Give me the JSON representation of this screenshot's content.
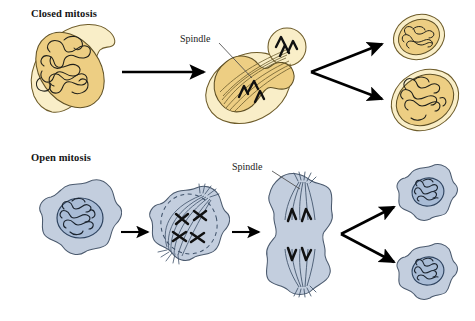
{
  "figure": {
    "title_closed": "Closed mitosis",
    "title_open": "Open mitosis",
    "spindle_label_closed": "Spindle",
    "spindle_label_open": "Spindle"
  },
  "colors": {
    "closed_cytoplasm": "#f9eec8",
    "closed_nucleus": "#edce83",
    "closed_outline": "#6e5c2a",
    "open_cytoplasm": "#c3cede",
    "open_nucleus": "#a9bcd6",
    "open_outline": "#4b5a6e",
    "chromatin": "#1c1c1c",
    "arrow": "#000000",
    "text": "#141414",
    "background": "#ffffff"
  },
  "rows": [
    {
      "name": "closed-mitosis",
      "label": "Closed mitosis",
      "envelope_behavior": "nuclear envelope remains intact",
      "division_type": "budding, unequal daughter cells",
      "stages": [
        {
          "name": "interphase",
          "description": "oval cell with intact nucleus containing tangled chromatin"
        },
        {
          "name": "mitosis",
          "description": "budding cell, spindle inside intact nuclear envelope spanning mother and bud"
        },
        {
          "name": "daughter-small",
          "description": "small daughter cell with nucleus"
        },
        {
          "name": "daughter-large",
          "description": "large daughter cell with nucleus"
        }
      ]
    },
    {
      "name": "open-mitosis",
      "label": "Open mitosis",
      "envelope_behavior": "nuclear envelope breaks down",
      "division_type": "equal daughter cells",
      "stages": [
        {
          "name": "interphase",
          "description": "amoeboid cell with intact round nucleus and chromatin"
        },
        {
          "name": "metaphase",
          "description": "nuclear envelope dashed/breaking down, condensed X chromosomes on spindle"
        },
        {
          "name": "anaphase",
          "description": "elongated dumbbell cell, chromosomes pulled to opposite poles by spindle"
        },
        {
          "name": "daughter-top",
          "description": "daughter cell with reformed nucleus"
        },
        {
          "name": "daughter-bottom",
          "description": "daughter cell with reformed nucleus"
        }
      ]
    }
  ]
}
